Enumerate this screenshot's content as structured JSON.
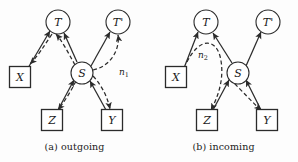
{
  "figure": {
    "background_color": "#fdfdfd",
    "stroke_color": "#2b2b2b"
  },
  "panels": [
    {
      "id": "a",
      "caption": "(a) outgoing",
      "nodes": [
        {
          "id": "T",
          "label": "T",
          "shape": "circle",
          "cx": 58,
          "cy": 22,
          "r": 12
        },
        {
          "id": "Tp",
          "label": "T'",
          "shape": "circle",
          "cx": 118,
          "cy": 22,
          "r": 12
        },
        {
          "id": "S",
          "label": "S",
          "shape": "circle",
          "cx": 82,
          "cy": 73,
          "r": 11
        },
        {
          "id": "X",
          "label": "X",
          "shape": "square",
          "cx": 20,
          "cy": 77,
          "size": 21
        },
        {
          "id": "Z",
          "label": "Z",
          "shape": "square",
          "cx": 52,
          "cy": 120,
          "size": 21
        },
        {
          "id": "Y",
          "label": "Y",
          "shape": "square",
          "cx": 112,
          "cy": 120,
          "size": 21
        }
      ],
      "noise_labels": [
        {
          "id": "n1",
          "base": "n",
          "sub": "1",
          "x": 124,
          "y": 72
        }
      ],
      "edges": [
        {
          "from": "X",
          "to": "T",
          "style": "solid",
          "arrow": "end"
        },
        {
          "from": "T",
          "to": "X",
          "style": "dashed",
          "arrow": "end",
          "curved": true
        },
        {
          "from": "S",
          "to": "T",
          "style": "solid",
          "arrow": "end"
        },
        {
          "from": "S",
          "to": "Tp",
          "style": "solid",
          "arrow": "end"
        },
        {
          "from": "Y",
          "to": "S",
          "style": "solid",
          "arrow": "end"
        },
        {
          "from": "Z",
          "to": "S",
          "style": "solid",
          "arrow": "end"
        },
        {
          "from": "S",
          "to": "Z",
          "style": "dashed",
          "arrow": "end"
        },
        {
          "from": "S",
          "to": "Y",
          "style": "dashed",
          "arrow": "end",
          "curved": true
        },
        {
          "from": "S",
          "to": "Tp",
          "style": "dashed",
          "arrow": "end",
          "curved": true
        }
      ]
    },
    {
      "id": "b",
      "caption": "(b) incoming",
      "nodes": [
        {
          "id": "T",
          "label": "T",
          "shape": "circle",
          "cx": 57,
          "cy": 22,
          "r": 12
        },
        {
          "id": "Tp",
          "label": "T'",
          "shape": "circle",
          "cx": 119,
          "cy": 22,
          "r": 12
        },
        {
          "id": "S",
          "label": "S",
          "shape": "circle",
          "cx": 89,
          "cy": 73,
          "r": 11
        },
        {
          "id": "X",
          "label": "X",
          "shape": "square",
          "cx": 27,
          "cy": 77,
          "size": 21
        },
        {
          "id": "Z",
          "label": "Z",
          "shape": "square",
          "cx": 58,
          "cy": 120,
          "size": 21
        },
        {
          "id": "Y",
          "label": "Y",
          "shape": "square",
          "cx": 118,
          "cy": 120,
          "size": 21
        }
      ],
      "noise_labels": [
        {
          "id": "n2",
          "base": "n",
          "sub": "2",
          "x": 54,
          "y": 55
        }
      ],
      "edges": [
        {
          "from": "X",
          "to": "T",
          "style": "solid",
          "arrow": "end"
        },
        {
          "from": "T",
          "to": "Z",
          "style": "dashed",
          "arrow": "end",
          "curved": true
        },
        {
          "from": "S",
          "to": "T",
          "style": "solid",
          "arrow": "end"
        },
        {
          "from": "S",
          "to": "Tp",
          "style": "solid",
          "arrow": "end"
        },
        {
          "from": "Z",
          "to": "S",
          "style": "solid",
          "arrow": "end"
        },
        {
          "from": "Y",
          "to": "S",
          "style": "solid",
          "arrow": "end"
        },
        {
          "from": "S",
          "to": "Y",
          "style": "dashed",
          "arrow": "end"
        }
      ]
    }
  ]
}
